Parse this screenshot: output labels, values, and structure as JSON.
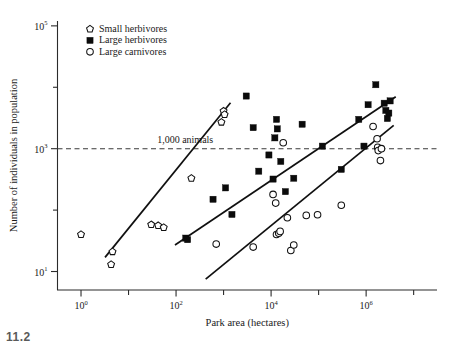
{
  "figure": {
    "caption_fragment": "11.2"
  },
  "chart_data": {
    "type": "scatter",
    "title": "",
    "xlabel": "Park area (hectares)",
    "ylabel": "Number of individuals in population",
    "xscale": "log",
    "yscale": "log",
    "xlim": [
      0.32,
      31000000
    ],
    "ylim": [
      5.0,
      120000
    ],
    "grid": false,
    "legend_position": "top-left-inside",
    "x_ticks_major": [
      "10^0",
      "10^2",
      "10^4",
      "10^6"
    ],
    "x_tick_labels": [
      "10",
      "10",
      "10",
      "10"
    ],
    "x_tick_exponents": [
      "0",
      "2",
      "4",
      "6"
    ],
    "y_ticks_major": [
      "10^1",
      "10^3",
      "10^5"
    ],
    "y_tick_labels": [
      "10",
      "10",
      "10"
    ],
    "y_tick_exponents": [
      "1",
      "3",
      "5"
    ],
    "annotations": [
      {
        "text": "1,000 animals",
        "x": 40,
        "y": 1400,
        "type": "reference-line-label"
      }
    ],
    "reference_line": {
      "y": 1000,
      "style": "dashed",
      "label": "1,000 animals"
    },
    "series": [
      {
        "name": "Small herbivores",
        "marker": "pentagon-open",
        "points": [
          [
            1.0,
            40
          ],
          [
            4.3,
            13
          ],
          [
            4.6,
            21
          ],
          [
            30,
            58
          ],
          [
            42,
            56
          ],
          [
            55,
            52
          ],
          [
            210,
            330
          ],
          [
            900,
            2700
          ],
          [
            1000,
            4100
          ],
          [
            1050,
            3600
          ]
        ],
        "trend_line": {
          "x1": 3.2,
          "y1": 17,
          "x2": 1400,
          "y2": 5600
        }
      },
      {
        "name": "Large herbivores",
        "marker": "square-filled",
        "points": [
          [
            160,
            35
          ],
          [
            175,
            33
          ],
          [
            600,
            150
          ],
          [
            1100,
            230
          ],
          [
            1500,
            85
          ],
          [
            3000,
            7200
          ],
          [
            4200,
            2200
          ],
          [
            5500,
            430
          ],
          [
            9000,
            790
          ],
          [
            11000,
            320
          ],
          [
            12000,
            1500
          ],
          [
            13000,
            3000
          ],
          [
            13500,
            2100
          ],
          [
            16000,
            620
          ],
          [
            20000,
            200
          ],
          [
            30000,
            330
          ],
          [
            45000,
            2500
          ],
          [
            120000,
            1100
          ],
          [
            300000,
            460
          ],
          [
            700000,
            3000
          ],
          [
            900000,
            1100
          ],
          [
            1100000,
            5200
          ],
          [
            1600000,
            11000
          ],
          [
            2400000,
            5500
          ],
          [
            2600000,
            4200
          ],
          [
            2800000,
            3100
          ],
          [
            3000000,
            3800
          ],
          [
            3200000,
            6000
          ]
        ],
        "trend_line": {
          "x1": 95,
          "y1": 27,
          "x2": 4200000,
          "y2": 7000
        }
      },
      {
        "name": "Large carnivores",
        "marker": "circle-open",
        "points": [
          [
            700,
            28
          ],
          [
            4200,
            25
          ],
          [
            11000,
            180
          ],
          [
            12500,
            130
          ],
          [
            13000,
            40
          ],
          [
            14500,
            42
          ],
          [
            15500,
            45
          ],
          [
            18000,
            1250
          ],
          [
            22000,
            75
          ],
          [
            26000,
            22
          ],
          [
            30000,
            27
          ],
          [
            55000,
            82
          ],
          [
            95000,
            84
          ],
          [
            300000,
            120
          ],
          [
            1400000,
            2300
          ],
          [
            1700000,
            1450
          ],
          [
            1750000,
            1050
          ],
          [
            1800000,
            930
          ],
          [
            2000000,
            640
          ],
          [
            2100000,
            1000
          ]
        ],
        "trend_line": {
          "x1": 420,
          "y1": 7.5,
          "x2": 3800000,
          "y2": 2400
        }
      }
    ]
  },
  "legend": {
    "entries": [
      {
        "label": "Small herbivores",
        "marker": "pentagon-open"
      },
      {
        "label": "Large herbivores",
        "marker": "square-filled"
      },
      {
        "label": "Large carnivores",
        "marker": "circle-open"
      }
    ]
  },
  "colors": {
    "axis": "#2b2b2b",
    "marker_stroke": "#111111",
    "marker_fill_open": "#ffffff",
    "marker_fill_solid": "#0b0b0b",
    "trend_line": "#101010",
    "reference_line": "#3a3a3a",
    "background": "#ffffff"
  }
}
